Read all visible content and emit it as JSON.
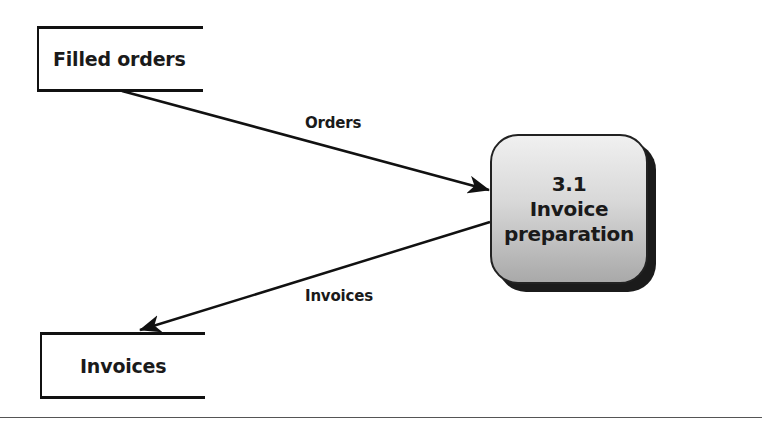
{
  "diagram": {
    "type": "data-flow-diagram",
    "data_stores": [
      {
        "id": "filled-orders",
        "label": "Filled orders"
      },
      {
        "id": "invoices",
        "label": "Invoices"
      }
    ],
    "process": {
      "number": "3.1",
      "name_line1": "Invoice",
      "name_line2": "preparation"
    },
    "flows": [
      {
        "label": "Orders",
        "from": "Filled orders",
        "to": "3.1 Invoice preparation"
      },
      {
        "label": "Invoices",
        "from": "3.1 Invoice preparation",
        "to": "Invoices"
      }
    ],
    "colors": {
      "stroke": "#111111",
      "process_fill_top": "#f0f0f0",
      "process_fill_bottom": "#a9a9a9",
      "process_shadow": "#1b1b1b",
      "divider": "#555555"
    }
  }
}
